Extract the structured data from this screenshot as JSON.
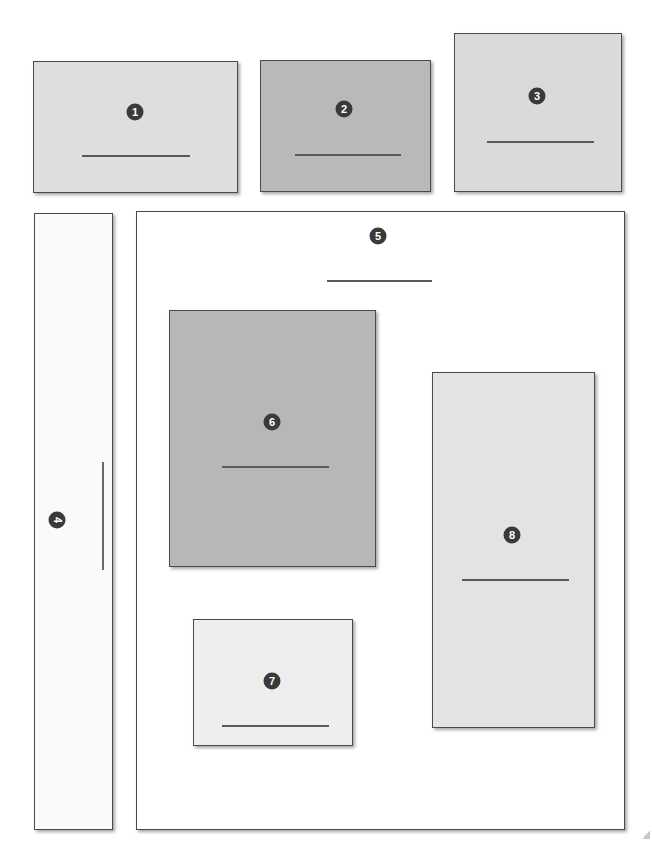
{
  "diagram": {
    "title": "",
    "regions": [
      {
        "id": "region-1",
        "label": "1",
        "fill": "#dedede",
        "x": 33,
        "y": 61,
        "w": 205,
        "h": 132,
        "line": {
          "x": 82,
          "y": 155,
          "w": 108,
          "orient": "h"
        }
      },
      {
        "id": "region-2",
        "label": "2",
        "fill": "#b9b9b9",
        "x": 260,
        "y": 60,
        "w": 171,
        "h": 132,
        "line": {
          "x": 295,
          "y": 154,
          "w": 106,
          "orient": "h"
        }
      },
      {
        "id": "region-3",
        "label": "3",
        "fill": "#dadada",
        "x": 454,
        "y": 33,
        "w": 168,
        "h": 159,
        "line": {
          "x": 487,
          "y": 141,
          "w": 107,
          "orient": "h"
        }
      },
      {
        "id": "region-4",
        "label": "4",
        "fill": "#fafafa",
        "x": 34,
        "y": 213,
        "w": 79,
        "h": 617,
        "line": {
          "x": 102,
          "y": 462,
          "w": 108,
          "orient": "v"
        },
        "rotated": true
      },
      {
        "id": "region-5",
        "label": "5",
        "fill": "#ffffff",
        "x": 136,
        "y": 211,
        "w": 489,
        "h": 619,
        "line": {
          "x": 327,
          "y": 280,
          "w": 105,
          "orient": "h"
        }
      },
      {
        "id": "region-6",
        "label": "6",
        "fill": "#b7b7b7",
        "x": 169,
        "y": 310,
        "w": 207,
        "h": 257,
        "line": {
          "x": 222,
          "y": 466,
          "w": 107,
          "orient": "h"
        }
      },
      {
        "id": "region-7",
        "label": "7",
        "fill": "#eeeeee",
        "x": 193,
        "y": 619,
        "w": 160,
        "h": 127,
        "line": {
          "x": 222,
          "y": 725,
          "w": 107,
          "orient": "h"
        }
      },
      {
        "id": "region-8",
        "label": "8",
        "fill": "#e3e3e3",
        "x": 432,
        "y": 372,
        "w": 163,
        "h": 356,
        "line": {
          "x": 462,
          "y": 579,
          "w": 107,
          "orient": "h"
        }
      }
    ],
    "badges": [
      {
        "label": "1",
        "cx": 135,
        "cy": 112
      },
      {
        "label": "2",
        "cx": 344,
        "cy": 109
      },
      {
        "label": "3",
        "cx": 537,
        "cy": 96
      },
      {
        "label": "4",
        "cx": 57,
        "cy": 520
      },
      {
        "label": "5",
        "cx": 378,
        "cy": 236
      },
      {
        "label": "6",
        "cx": 272,
        "cy": 422
      },
      {
        "label": "7",
        "cx": 272,
        "cy": 681
      },
      {
        "label": "8",
        "cx": 512,
        "cy": 535
      }
    ],
    "colors": {
      "border": "#4a4a4a",
      "badge": "#3a3a3a",
      "badge_text": "#ffffff",
      "line": "#5a5a5a"
    }
  }
}
